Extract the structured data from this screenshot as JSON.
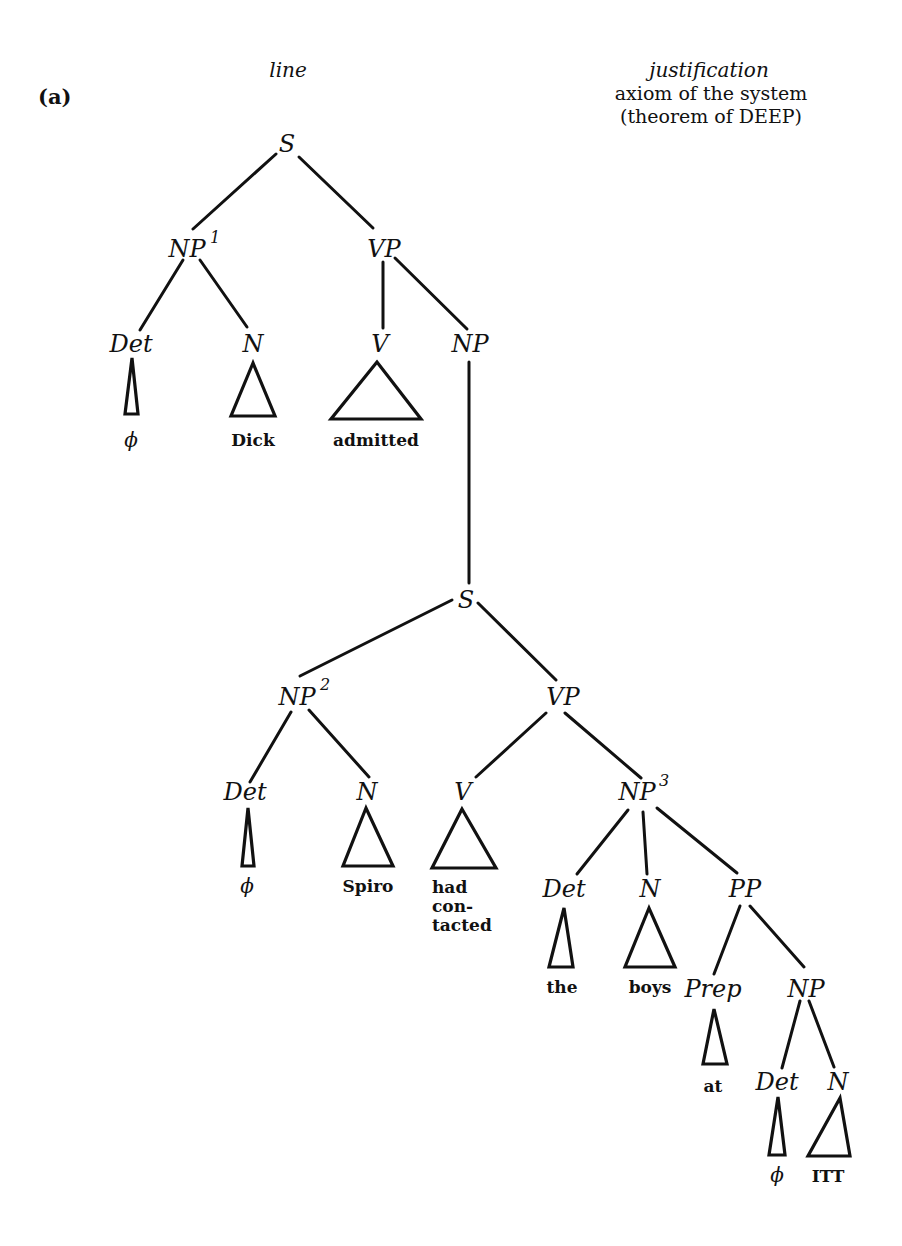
{
  "panel": {
    "label": "(a)"
  },
  "columns": {
    "line_header": "line",
    "justification_header": "justification",
    "justification_lines": [
      "axiom of the system",
      "(theorem of DEEP)"
    ]
  },
  "tree": {
    "nodes": {
      "s_root": {
        "label": "S"
      },
      "np1": {
        "label": "NP",
        "sup": "1"
      },
      "vp1": {
        "label": "VP"
      },
      "det1": {
        "label": "Det"
      },
      "n1": {
        "label": "N"
      },
      "v1": {
        "label": "V"
      },
      "np_obj": {
        "label": "NP"
      },
      "s_embedded": {
        "label": "S"
      },
      "np2": {
        "label": "NP",
        "sup": "2"
      },
      "vp2": {
        "label": "VP"
      },
      "det2": {
        "label": "Det"
      },
      "n2": {
        "label": "N"
      },
      "v2": {
        "label": "V"
      },
      "np3": {
        "label": "NP",
        "sup": "3"
      },
      "det3": {
        "label": "Det"
      },
      "n3": {
        "label": "N"
      },
      "pp": {
        "label": "PP"
      },
      "prep": {
        "label": "Prep"
      },
      "np4": {
        "label": "NP"
      },
      "det4": {
        "label": "Det"
      },
      "n4": {
        "label": "N"
      }
    },
    "leaves": {
      "det1": "ϕ",
      "n1": "Dick",
      "v1": "admitted",
      "det2": "ϕ",
      "n2": "Spiro",
      "v2_lines": [
        "had",
        "con-",
        "tacted"
      ],
      "det3": "the",
      "n3": "boys",
      "prep": "at",
      "det4": "ϕ",
      "n4": "ITT"
    }
  },
  "colors": {
    "ink": "#111111",
    "paper": "#ffffff"
  }
}
